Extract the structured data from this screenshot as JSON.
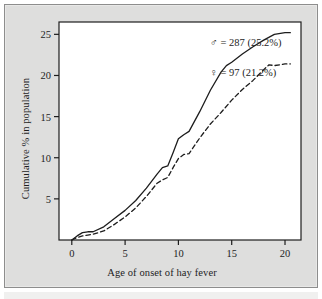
{
  "figure": {
    "background_color": "#dededd",
    "plot_background_color": "#ffffff",
    "frame_color": "#1d1d1d",
    "line_color": "#1d1d1d"
  },
  "chart_data": {
    "type": "line",
    "title": "",
    "xlabel": "Age of onset of hay fever",
    "ylabel": "Cumulative % in population",
    "xlim": [
      -1.2,
      21.5
    ],
    "ylim": [
      0,
      26.5
    ],
    "xticks": [
      0,
      5,
      10,
      15,
      20
    ],
    "yticks": [
      5,
      10,
      15,
      20,
      25
    ],
    "xtick_labels": [
      "0",
      "5",
      "10",
      "15",
      "20"
    ],
    "ytick_labels": [
      "5",
      "10",
      "15",
      "20",
      "25"
    ],
    "grid": false,
    "legend_position": "inline-annotation",
    "series": [
      {
        "name": "male",
        "symbol": "♂",
        "annotation": "♂ = 287 (25.2%)",
        "count": 287,
        "percent": 25.2,
        "linestyle": "solid",
        "x": [
          0,
          0.5,
          1,
          1.5,
          2,
          3,
          4,
          5,
          6,
          7,
          8,
          8.5,
          9,
          9.5,
          10,
          10.5,
          11,
          12,
          13,
          14,
          14.5,
          15,
          16,
          17,
          18,
          19,
          20,
          20.5
        ],
        "values": [
          0,
          0.5,
          0.9,
          1.0,
          1.0,
          1.6,
          2.6,
          3.6,
          4.8,
          6.3,
          8.0,
          8.8,
          9.0,
          10.6,
          12.3,
          12.8,
          13.2,
          15.6,
          18.2,
          20.4,
          21.2,
          21.6,
          22.6,
          23.5,
          24.3,
          25.0,
          25.2,
          25.2
        ]
      },
      {
        "name": "female",
        "symbol": "♀",
        "annotation": "♀ = 97 (21.2%)",
        "count": 97,
        "percent": 21.2,
        "linestyle": "dashed",
        "x": [
          0,
          0.5,
          1,
          1.5,
          2,
          3,
          4,
          5,
          6,
          7,
          8,
          8.5,
          9,
          9.5,
          10,
          10.5,
          11,
          12,
          13,
          14,
          15,
          16,
          17,
          18,
          18.5,
          19,
          20,
          20.5
        ],
        "values": [
          0,
          0.3,
          0.5,
          0.6,
          0.7,
          1.1,
          1.9,
          2.8,
          3.9,
          5.3,
          6.9,
          7.3,
          7.6,
          8.8,
          9.9,
          10.4,
          10.5,
          12.4,
          14.1,
          15.5,
          17.0,
          18.3,
          19.4,
          20.7,
          21.3,
          21.2,
          21.4,
          21.4
        ]
      }
    ]
  }
}
